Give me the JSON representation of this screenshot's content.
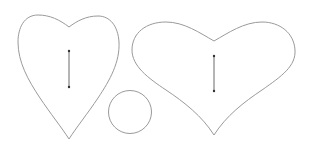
{
  "canvas": {
    "width": 310,
    "height": 149,
    "background": "#ffffff"
  },
  "colors": {
    "outline": "#9a9a9a",
    "line": "#6a6a6a",
    "dot": "#333333"
  },
  "shapes": [
    {
      "type": "heart",
      "name": "tall-heart",
      "orientation": "tall"
    },
    {
      "type": "circle",
      "name": "small-circle"
    },
    {
      "type": "heart",
      "name": "wide-heart",
      "orientation": "wide"
    }
  ],
  "markers": [
    {
      "name": "tall-heart-grainline",
      "type": "vertical-line-with-end-dots"
    },
    {
      "name": "wide-heart-grainline",
      "type": "vertical-line-with-end-dots"
    }
  ]
}
